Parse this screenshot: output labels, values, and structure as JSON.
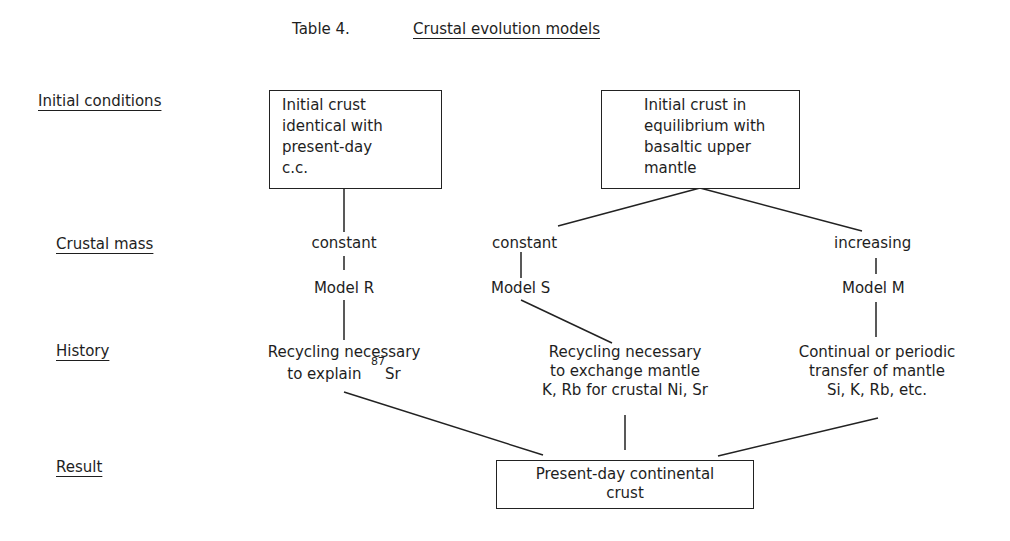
{
  "header": {
    "table_label": "Table 4.",
    "title": "Crustal evolution models"
  },
  "row_labels": {
    "initial_conditions": "Initial conditions",
    "crustal_mass": "Crustal mass",
    "history": "History",
    "result": "Result"
  },
  "initial_boxes": {
    "left": [
      "Initial crust",
      "identical with",
      "present-day",
      "c.c."
    ],
    "right": [
      "Initial crust in",
      "equilibrium with",
      "basaltic upper",
      "mantle"
    ]
  },
  "crustal_mass": {
    "model_r": "constant",
    "model_s": "constant",
    "model_m": "increasing"
  },
  "models": {
    "r": "Model R",
    "s": "Model S",
    "m": "Model M"
  },
  "history": {
    "r": {
      "line1": "Recycling necessary",
      "line2_prefix": "to explain",
      "isotope_mass": "87",
      "isotope_element": "Sr"
    },
    "s": {
      "line1": "Recycling necessary",
      "line2": "to exchange mantle",
      "line3": "K, Rb for crustal Ni, Sr"
    },
    "m": {
      "line1": "Continual or periodic",
      "line2": "transfer of mantle",
      "line3": "Si, K, Rb, etc."
    }
  },
  "result_box": {
    "line1": "Present-day continental",
    "line2": "crust"
  },
  "colors": {
    "ink": "#1e1e1e",
    "background": "#ffffff"
  }
}
